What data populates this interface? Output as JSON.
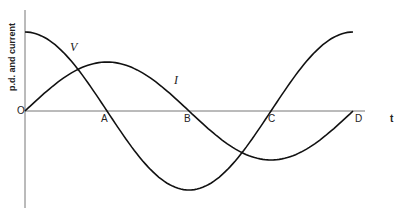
{
  "diagram": {
    "y_axis_label": "p.d. and current",
    "x_axis_label": "t",
    "origin_label": "O",
    "points": [
      "A",
      "B",
      "C",
      "D"
    ],
    "curves": [
      {
        "name": "V",
        "shape": "cosine",
        "label": "V"
      },
      {
        "name": "I",
        "shape": "sine",
        "label": "I"
      }
    ]
  }
}
